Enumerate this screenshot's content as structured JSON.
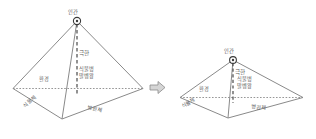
{
  "diagram": {
    "type": "plant-disease-pyramid-comparison",
    "line_color": "#808080",
    "text_color": "#5a5a5a",
    "background": "#ffffff",
    "transition_symbol": "⇒",
    "pyramids": [
      {
        "id": "left",
        "state": "tall",
        "apex_label": "인간",
        "vertical_axis_label": "극한",
        "center_label": "식물병\n말벵왕",
        "left_face_label": "환경",
        "front_left_edge_label": "식물체",
        "front_right_edge_label": "병원체"
      },
      {
        "id": "right",
        "state": "flattened",
        "apex_label": "인간",
        "vertical_axis_label": "극한",
        "center_label": "식물병\n말벵왕",
        "left_face_label": "환경",
        "front_left_edge_label": "식물체",
        "front_right_edge_label": "병원체"
      }
    ]
  }
}
